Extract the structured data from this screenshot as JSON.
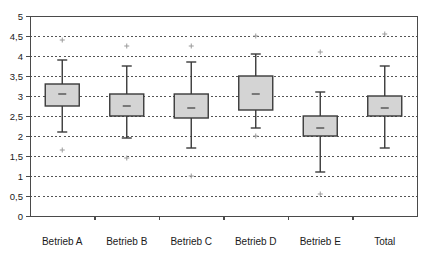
{
  "chart_data": {
    "type": "box",
    "title": "",
    "subtitle": "",
    "xlabel": "",
    "ylabel": "",
    "categories": [
      "Betrieb A",
      "Betrieb B",
      "Betrieb C",
      "Betrieb D",
      "Betrieb E",
      "Total"
    ],
    "ylim": [
      0,
      5
    ],
    "ytick_values": [
      0,
      0.5,
      1,
      1.5,
      2,
      2.5,
      3,
      3.5,
      4,
      4.5,
      5
    ],
    "ytick_labels": [
      "0",
      "0,5",
      "1",
      "1,5",
      "2",
      "2,5",
      "3",
      "3,5",
      "4",
      "4,5",
      "5"
    ],
    "grid": "horizontal-dashed",
    "legend": "none",
    "decimal_separator": ",",
    "series": [
      {
        "name": "Betrieb A",
        "whisker_low": 2.1,
        "q1": 2.75,
        "median": 3.05,
        "q3": 3.3,
        "whisker_high": 3.9,
        "outliers": [
          4.4,
          1.65
        ]
      },
      {
        "name": "Betrieb B",
        "whisker_low": 1.95,
        "q1": 2.5,
        "median": 2.75,
        "q3": 3.05,
        "whisker_high": 3.75,
        "outliers": [
          4.25,
          1.45
        ]
      },
      {
        "name": "Betrieb C",
        "whisker_low": 1.7,
        "q1": 2.45,
        "median": 2.7,
        "q3": 3.05,
        "whisker_high": 3.85,
        "outliers": [
          4.25,
          1.0
        ]
      },
      {
        "name": "Betrieb D",
        "whisker_low": 2.2,
        "q1": 2.65,
        "median": 3.05,
        "q3": 3.5,
        "whisker_high": 4.05,
        "outliers": [
          4.5,
          2.0
        ]
      },
      {
        "name": "Betrieb E",
        "whisker_low": 1.1,
        "q1": 2.0,
        "median": 2.2,
        "q3": 2.5,
        "whisker_high": 3.1,
        "outliers": [
          4.1,
          0.55
        ]
      },
      {
        "name": "Total",
        "whisker_low": 1.7,
        "q1": 2.5,
        "median": 2.7,
        "q3": 3.0,
        "whisker_high": 3.75,
        "outliers": [
          4.55
        ]
      }
    ],
    "colors": {
      "box_fill": "#d4d4d4",
      "box_stroke": "#3a3a3a",
      "grid": "#555555",
      "frame": "#4a4a4a",
      "outlier": "#9a9a9a",
      "text": "#1a1a1a",
      "background": "#ffffff"
    }
  },
  "layout": {
    "plot_left": 30,
    "plot_right": 417,
    "plot_top": 16,
    "plot_bottom": 216,
    "x_label_y": 245
  }
}
